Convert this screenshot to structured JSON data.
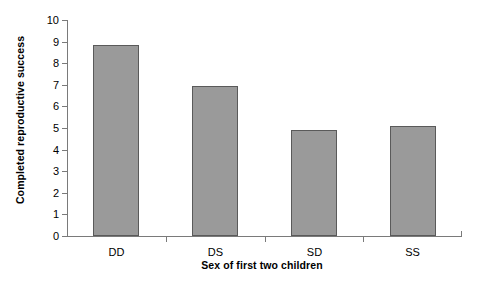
{
  "chart_data": {
    "type": "bar",
    "title": "",
    "xlabel": "Sex of first two children",
    "ylabel": "Completed reproductive success",
    "categories": [
      "DD",
      "DS",
      "SD",
      "SS"
    ],
    "values": [
      8.85,
      6.95,
      4.9,
      5.1
    ],
    "ylim": [
      0,
      10
    ],
    "ytick_labels": [
      "0",
      "1",
      "2",
      "3",
      "4",
      "5",
      "6",
      "7",
      "8",
      "9",
      "10"
    ],
    "ytick_values": [
      0,
      1,
      2,
      3,
      4,
      5,
      6,
      7,
      8,
      9,
      10
    ],
    "grid": false,
    "legend": false,
    "legend_position": "none",
    "bar_fill_color": "#9a9a9a",
    "bar_border_color": "#5a5a5a",
    "axis_color": "#7a7a7a",
    "background_color": "#ffffff"
  }
}
